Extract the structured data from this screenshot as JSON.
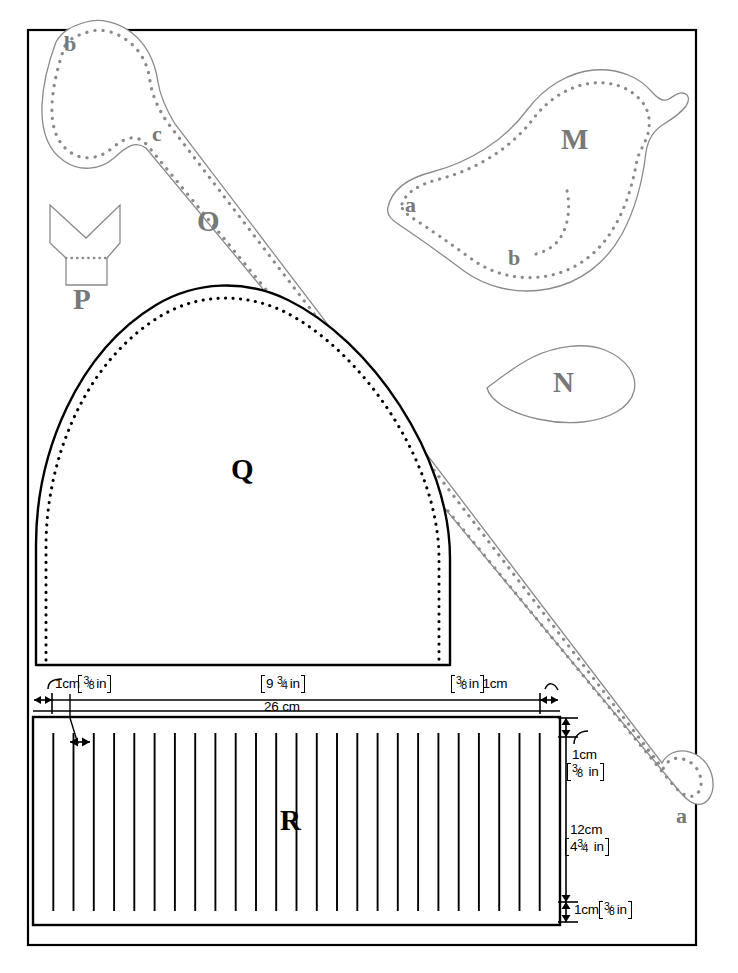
{
  "sheet": {
    "title": "Sewing pattern layout sheet",
    "border_color": "#000000",
    "outline_color": "#8a8a8a",
    "stitch_color": "#8a8a8a",
    "ink_color": "#000000"
  },
  "pieces": [
    {
      "id": "M",
      "label": "M",
      "type": "bird-body",
      "marks": [
        {
          "label": "a"
        },
        {
          "label": "b"
        }
      ]
    },
    {
      "id": "N",
      "label": "N",
      "type": "leaf",
      "marks": []
    },
    {
      "id": "O",
      "label": "O",
      "type": "long-strip",
      "marks": [
        {
          "label": "b"
        },
        {
          "label": "c"
        },
        {
          "label": "a"
        }
      ]
    },
    {
      "id": "P",
      "label": "P",
      "type": "notched-tab",
      "marks": []
    },
    {
      "id": "Q",
      "label": "Q",
      "type": "dome",
      "marks": []
    },
    {
      "id": "R",
      "label": "R",
      "type": "striped-rectangle",
      "marks": []
    }
  ],
  "dimensions": {
    "top_left_seam": {
      "cm": "1cm",
      "in_whole": "",
      "in_num": "3",
      "in_den": "8",
      "in_unit": "in"
    },
    "top_middle": {
      "cm": "",
      "in_whole": "9",
      "in_num": "3",
      "in_den": "4",
      "in_unit": "in"
    },
    "top_right_seam": {
      "cm": "1cm",
      "in_whole": "",
      "in_num": "3",
      "in_den": "8",
      "in_unit": "in"
    },
    "overall_width": "26 cm",
    "right_top_seam": {
      "cm": "1cm",
      "in_whole": "",
      "in_num": "3",
      "in_den": "8",
      "in_unit": "in"
    },
    "right_height": {
      "cm": "12cm",
      "in_whole": "4",
      "in_num": "3",
      "in_den": "4",
      "in_unit": "in"
    },
    "right_bottom_seam": {
      "cm": "1cm",
      "in_whole": "",
      "in_num": "3",
      "in_den": "8",
      "in_unit": "in"
    }
  },
  "stripes": {
    "count": 26,
    "spacing_cm": 1
  }
}
